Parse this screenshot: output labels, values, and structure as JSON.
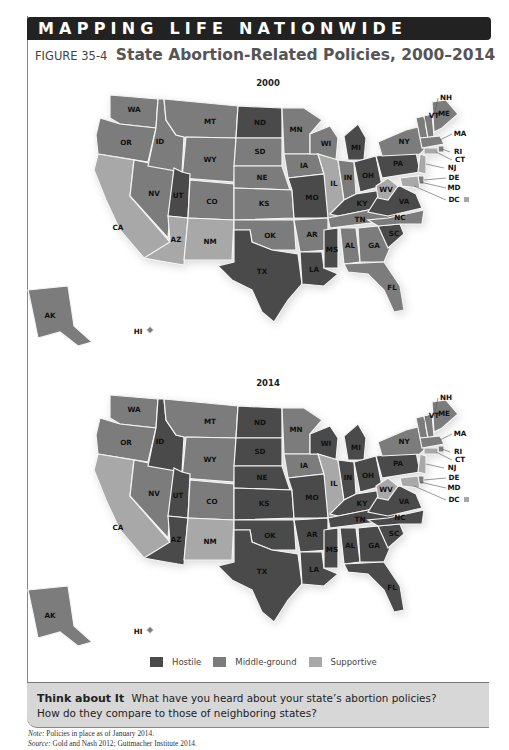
{
  "banner": {
    "title": "MAPPING LIFE NATIONWIDE"
  },
  "figure": {
    "number": "FIGURE 35-4",
    "title": "State Abortion-Related Policies, 2000–2014"
  },
  "colors": {
    "hostile": "#4a4a4a",
    "middle": "#7c7c7c",
    "supportive": "#a8a8a8"
  },
  "legend": [
    {
      "key": "hostile",
      "label": "Hostile"
    },
    {
      "key": "middle",
      "label": "Middle-ground"
    },
    {
      "key": "supportive",
      "label": "Supportive"
    }
  ],
  "chart_data": [
    {
      "type": "choropleth",
      "title": "2000",
      "categories": [
        "Hostile",
        "Middle-ground",
        "Supportive"
      ],
      "values": {
        "WA": "middle",
        "OR": "middle",
        "CA": "supportive",
        "NV": "middle",
        "ID": "middle",
        "MT": "middle",
        "WY": "middle",
        "UT": "hostile",
        "CO": "middle",
        "AZ": "supportive",
        "NM": "supportive",
        "ND": "hostile",
        "SD": "middle",
        "NE": "middle",
        "KS": "middle",
        "OK": "middle",
        "TX": "hostile",
        "MN": "middle",
        "IA": "middle",
        "MO": "hostile",
        "AR": "middle",
        "LA": "hostile",
        "WI": "middle",
        "IL": "supportive",
        "MI": "hostile",
        "IN": "middle",
        "OH": "hostile",
        "KY": "hostile",
        "TN": "middle",
        "MS": "hostile",
        "AL": "middle",
        "GA": "middle",
        "FL": "middle",
        "SC": "hostile",
        "NC": "middle",
        "VA": "hostile",
        "WV": "supportive",
        "PA": "hostile",
        "NY": "middle",
        "VT": "middle",
        "NH": "middle",
        "ME": "middle",
        "MA": "middle",
        "RI": "middle",
        "CT": "supportive",
        "NJ": "supportive",
        "DE": "middle",
        "MD": "supportive",
        "DC": "supportive",
        "AK": "middle",
        "HI": "middle"
      }
    },
    {
      "type": "choropleth",
      "title": "2014",
      "categories": [
        "Hostile",
        "Middle-ground",
        "Supportive"
      ],
      "values": {
        "WA": "middle",
        "OR": "middle",
        "CA": "supportive",
        "NV": "middle",
        "ID": "hostile",
        "MT": "middle",
        "WY": "middle",
        "UT": "hostile",
        "CO": "middle",
        "AZ": "hostile",
        "NM": "supportive",
        "ND": "hostile",
        "SD": "hostile",
        "NE": "hostile",
        "KS": "hostile",
        "OK": "hostile",
        "TX": "hostile",
        "MN": "middle",
        "IA": "middle",
        "MO": "hostile",
        "AR": "hostile",
        "LA": "hostile",
        "WI": "hostile",
        "IL": "supportive",
        "MI": "hostile",
        "IN": "hostile",
        "OH": "hostile",
        "KY": "hostile",
        "TN": "hostile",
        "MS": "hostile",
        "AL": "hostile",
        "GA": "hostile",
        "FL": "hostile",
        "SC": "hostile",
        "NC": "hostile",
        "VA": "hostile",
        "WV": "supportive",
        "PA": "hostile",
        "NY": "middle",
        "VT": "middle",
        "NH": "middle",
        "ME": "middle",
        "MA": "middle",
        "RI": "middle",
        "CT": "supportive",
        "NJ": "supportive",
        "DE": "middle",
        "MD": "supportive",
        "DC": "supportive",
        "AK": "middle",
        "HI": "middle"
      }
    }
  ],
  "maps": [
    {
      "year": "2000"
    },
    {
      "year": "2014"
    }
  ],
  "think": {
    "heading": "Think about It",
    "text": "What have you heard about your state’s abortion policies? How do they compare to those of neighboring states?"
  },
  "notes": {
    "note_label": "Note:",
    "note_text": " Policies in place as of January 2014.",
    "source_label": "Source:",
    "source_text": " Gold and Nash 2012; Guttmacher Institute 2014."
  }
}
